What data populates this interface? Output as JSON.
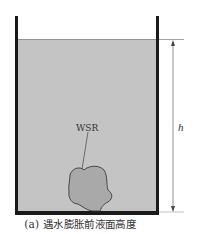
{
  "figure": {
    "caption": "(a) 遇水膨胀前液面高度",
    "labels": {
      "sample": "WSR",
      "height": "h"
    },
    "colors": {
      "liquid": "#c4c4c4",
      "sample": "#a9a9a9",
      "wall": "#1a1a1a",
      "line": "#555555",
      "text": "#333333"
    }
  }
}
